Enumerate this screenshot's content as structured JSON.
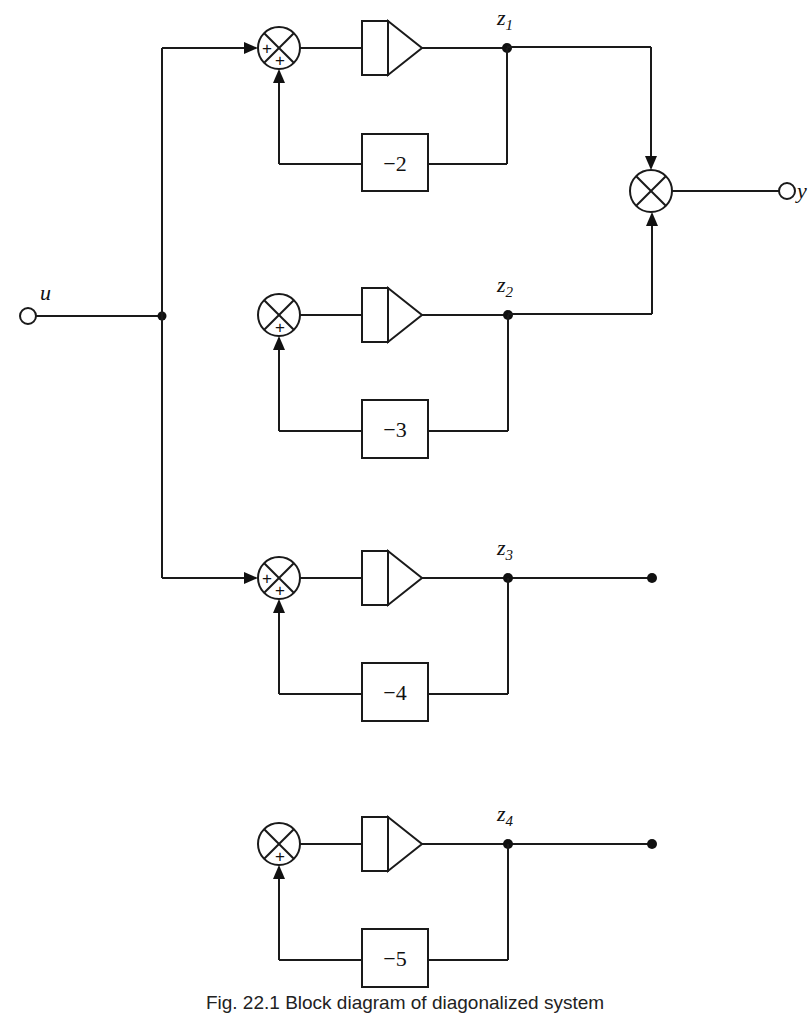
{
  "diagram": {
    "type": "block-diagram",
    "input": {
      "label": "u"
    },
    "output": {
      "label": "y"
    },
    "branches": [
      {
        "state": "z",
        "index": "1",
        "feedback_gain": "−2",
        "summer_signs": [
          "+",
          "+"
        ],
        "has_input": true,
        "to_output": true
      },
      {
        "state": "z",
        "index": "2",
        "feedback_gain": "−3",
        "summer_signs": [
          "+"
        ],
        "has_input": false,
        "to_output": true
      },
      {
        "state": "z",
        "index": "3",
        "feedback_gain": "−4",
        "summer_signs": [
          "+",
          "+"
        ],
        "has_input": true,
        "to_output": false
      },
      {
        "state": "z",
        "index": "4",
        "feedback_gain": "−5",
        "summer_signs": [
          "+"
        ],
        "has_input": false,
        "to_output": false
      }
    ],
    "output_junction": "summing-junction (z1 + z2)",
    "caption": "Fig. 22.1  Block diagram of diagonalized system"
  }
}
